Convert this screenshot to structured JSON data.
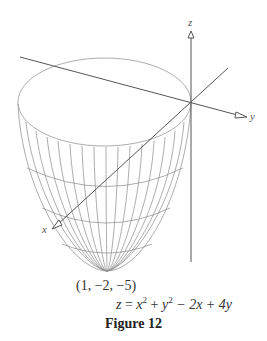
{
  "figure": {
    "caption": "Figure 12",
    "axes": {
      "x_label": "x",
      "y_label": "y",
      "z_label": "z"
    },
    "vertex_label": "(1, −2, −5)",
    "equation": {
      "lhs": "z",
      "eq": " = ",
      "t1": "x",
      "e1": "2",
      "p1": " + ",
      "t2": "y",
      "e2": "2",
      "m1": " − 2x + 4y"
    },
    "colors": {
      "surface": "#8a8a8a",
      "axes": "#555555"
    }
  }
}
